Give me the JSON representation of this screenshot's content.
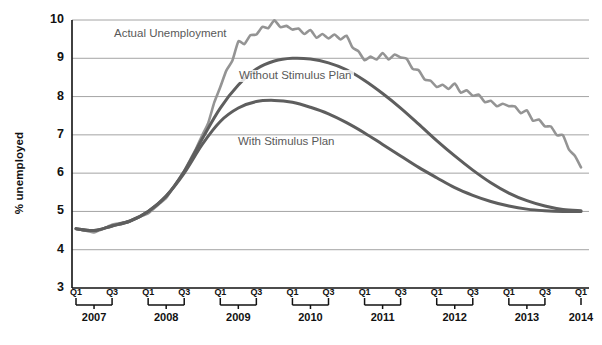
{
  "chart_data": {
    "type": "line",
    "title": "",
    "subtitle": "",
    "xlabel": "",
    "ylabel": "% unemployed",
    "ylim": [
      3,
      10
    ],
    "ytick_labels": [
      "3",
      "4",
      "5",
      "6",
      "7",
      "8",
      "9",
      "10"
    ],
    "ytick_values": [
      3,
      4,
      5,
      6,
      7,
      8,
      9,
      10
    ],
    "grid": true,
    "legend_position": "inline-annotations",
    "x_quarter_labels": [
      "Q1",
      "Q3"
    ],
    "x_years": [
      "2007",
      "2008",
      "2009",
      "2010",
      "2011",
      "2012",
      "2013",
      "2014"
    ],
    "x": [
      "2007Q1",
      "2007Q2",
      "2007Q3",
      "2007Q4",
      "2008Q1",
      "2008Q2",
      "2008Q3",
      "2008Q4",
      "2009Q1",
      "2009Q2",
      "2009Q3",
      "2009Q4",
      "2010Q1",
      "2010Q2",
      "2010Q3",
      "2010Q4",
      "2011Q1",
      "2011Q2",
      "2011Q3",
      "2011Q4",
      "2012Q1",
      "2012Q2",
      "2012Q3",
      "2012Q4",
      "2013Q1",
      "2013Q2",
      "2013Q3",
      "2013Q4",
      "2014Q1"
    ],
    "series": [
      {
        "name": "Actual Unemployment",
        "color": "#949494",
        "values": [
          4.55,
          4.45,
          4.65,
          4.75,
          4.95,
          5.35,
          6.05,
          6.95,
          8.25,
          9.35,
          9.65,
          9.95,
          9.75,
          9.65,
          9.55,
          9.55,
          8.95,
          9.05,
          9.05,
          8.65,
          8.25,
          8.25,
          8.05,
          7.85,
          7.75,
          7.55,
          7.25,
          6.95,
          6.15
        ]
      },
      {
        "name": "Without Stimulus Plan",
        "color": "#5e5e5e",
        "values": [
          4.55,
          4.5,
          4.62,
          4.75,
          5.0,
          5.4,
          6.05,
          6.9,
          7.7,
          8.3,
          8.72,
          8.93,
          9.0,
          8.98,
          8.88,
          8.7,
          8.42,
          8.08,
          7.7,
          7.28,
          6.85,
          6.45,
          6.08,
          5.75,
          5.48,
          5.28,
          5.14,
          5.05,
          5.02
        ]
      },
      {
        "name": "With Stimulus Plan",
        "color": "#5e5e5e",
        "values": [
          4.55,
          4.5,
          4.62,
          4.75,
          5.0,
          5.4,
          6.0,
          6.75,
          7.35,
          7.7,
          7.87,
          7.9,
          7.85,
          7.72,
          7.55,
          7.32,
          7.05,
          6.75,
          6.45,
          6.15,
          5.88,
          5.62,
          5.42,
          5.26,
          5.14,
          5.06,
          5.02,
          5.0,
          5.0
        ]
      }
    ],
    "annotations": [
      {
        "text": "Actual Unemployment",
        "x_px": 112,
        "y_px": 28
      },
      {
        "text": "Without Stimulus Plan",
        "x_px": 237,
        "y_px": 70
      },
      {
        "text": "With Stimulus Plan",
        "x_px": 236,
        "y_px": 136
      }
    ],
    "colors": {
      "actual": "#949494",
      "projection": "#5e5e5e",
      "grid": "#9a9a9a",
      "axis": "#111111",
      "background": "#ffffff",
      "annotation_text": "#595959"
    }
  }
}
